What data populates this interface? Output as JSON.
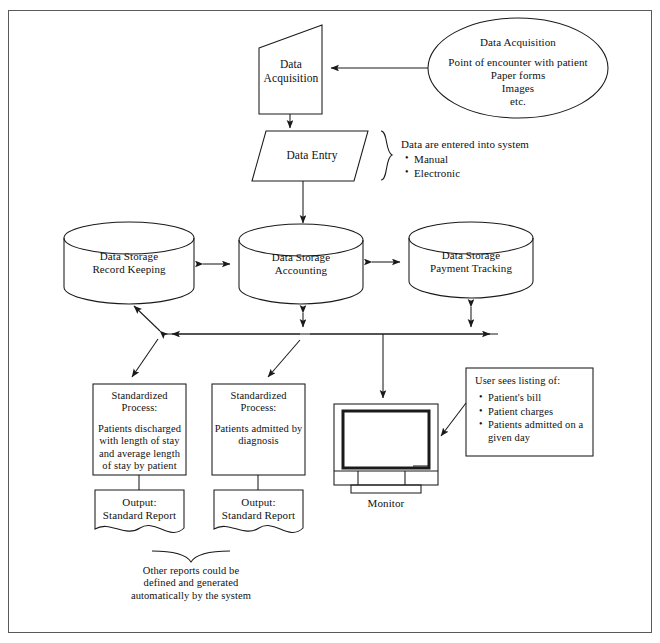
{
  "diagram": {
    "nodes": {
      "data_acquisition_process": {
        "line1": "Data",
        "line2": "Acquisition"
      },
      "data_acquisition_source": {
        "title": "Data Acquisition",
        "items": [
          "Point of encounter with patient",
          "Paper forms",
          "Images",
          "etc."
        ]
      },
      "data_entry": {
        "label": "Data Entry"
      },
      "data_entry_note": {
        "heading": "Data are entered into system",
        "bullets": [
          "Manual",
          "Electronic"
        ]
      },
      "storage_record_keeping": {
        "line1": "Data Storage",
        "line2": "Record Keeping"
      },
      "storage_accounting": {
        "line1": "Data Storage",
        "line2": "Accounting"
      },
      "storage_payment_tracking": {
        "line1": "Data Storage",
        "line2": "Payment Tracking"
      },
      "process_discharged": {
        "line1": "Standardized",
        "line2": "Process:",
        "body": "Patients discharged with length of stay and average length of stay by patient"
      },
      "process_admitted": {
        "line1": "Standardized",
        "line2": "Process:",
        "body": "Patients admitted by diagnosis"
      },
      "output_left": {
        "line1": "Output:",
        "line2": "Standard Report"
      },
      "output_right": {
        "line1": "Output:",
        "line2": "Standard Report"
      },
      "monitor": {
        "caption": "Monitor"
      },
      "user_listing": {
        "heading": "User sees listing of:",
        "bullets": [
          "Patient's bill",
          "Patient charges",
          "Patients admitted on a given day"
        ]
      },
      "bottom_note": {
        "text": "Other reports could be defined and generated automatically by the system"
      }
    },
    "colors": {
      "stroke": "#1a1a1a",
      "frame": "#5a5a5a",
      "background": "#ffffff",
      "screen_border": "#111111"
    }
  }
}
